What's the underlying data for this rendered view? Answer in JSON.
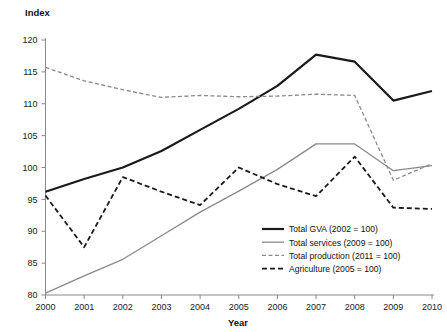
{
  "chart_data": {
    "type": "line",
    "title": "",
    "xlabel": "Year",
    "ylabel": "Index",
    "x": [
      2000,
      2001,
      2002,
      2003,
      2004,
      2005,
      2006,
      2007,
      2008,
      2009,
      2010
    ],
    "xtick_labels": [
      "2000",
      "2001",
      "2002",
      "2003",
      "2004",
      "2005",
      "2006",
      "2007",
      "2008",
      "2009",
      "2010"
    ],
    "ytick_labels": [
      "80",
      "85",
      "90",
      "95",
      "100",
      "105",
      "110",
      "115",
      "120"
    ],
    "yticks": [
      80,
      85,
      90,
      95,
      100,
      105,
      110,
      115,
      120
    ],
    "ylim": [
      80,
      120
    ],
    "xlim": [
      2000,
      2010
    ],
    "grid": false,
    "legend_position": "inside-lower-right",
    "series": [
      {
        "name": "Total GVA (2002 = 100)",
        "style": "solid",
        "color": "#1a1a1a",
        "width": 2.2,
        "values": [
          96.2,
          98.2,
          100.0,
          102.6,
          105.9,
          109.2,
          112.8,
          117.7,
          116.6,
          110.5,
          112.0
        ]
      },
      {
        "name": "Total services (2009 = 100)",
        "style": "solid",
        "color": "#8a8a8a",
        "width": 1.3,
        "values": [
          80.3,
          83.0,
          85.6,
          89.3,
          93.0,
          96.3,
          99.7,
          103.7,
          103.7,
          99.5,
          100.3
        ]
      },
      {
        "name": "Total production (2011 = 100)",
        "style": "dashed-light",
        "color": "#8a8a8a",
        "width": 1.3,
        "values": [
          115.7,
          113.6,
          112.2,
          111.0,
          111.3,
          111.1,
          111.2,
          111.5,
          111.3,
          98.0,
          100.6
        ]
      },
      {
        "name": "Agriculture (2005 = 100)",
        "style": "dashed-dark",
        "color": "#1a1a1a",
        "width": 1.8,
        "values": [
          95.6,
          87.5,
          98.5,
          96.2,
          94.1,
          100.0,
          97.4,
          95.5,
          101.7,
          93.7,
          93.5
        ]
      }
    ]
  }
}
